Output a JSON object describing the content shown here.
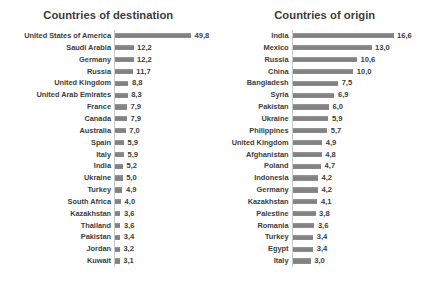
{
  "chart_data": [
    {
      "type": "bar",
      "orientation": "horizontal",
      "title": "Countries of destination",
      "xlabel": "",
      "ylabel": "",
      "grid": false,
      "legend": "none",
      "value_format": "comma-decimal",
      "xlim": [
        0,
        49.8
      ],
      "categories": [
        "United States of America",
        "Saudi Arabia",
        "Germany",
        "Russia",
        "United Kingdom",
        "United Arab Emirates",
        "France",
        "Canada",
        "Australia",
        "Spain",
        "Italy",
        "India",
        "Ukraine",
        "Turkey",
        "South Africa",
        "Kazakhstan",
        "Thailand",
        "Pakistan",
        "Jordan",
        "Kuwait"
      ],
      "values": [
        49.8,
        12.2,
        12.2,
        11.7,
        8.8,
        8.3,
        7.9,
        7.9,
        7.0,
        5.9,
        5.9,
        5.2,
        5.0,
        4.9,
        4.0,
        3.6,
        3.6,
        3.4,
        3.2,
        3.1
      ],
      "value_labels": [
        "49,8",
        "12,2",
        "12,2",
        "11,7",
        "8,8",
        "8,3",
        "7,9",
        "7,9",
        "7,0",
        "5,9",
        "5,9",
        "5,2",
        "5,0",
        "4,9",
        "4,0",
        "3,6",
        "3,6",
        "3,4",
        "3,2",
        "3,1"
      ]
    },
    {
      "type": "bar",
      "orientation": "horizontal",
      "title": "Countries of origin",
      "xlabel": "",
      "ylabel": "",
      "grid": false,
      "legend": "none",
      "value_format": "comma-decimal",
      "xlim": [
        0,
        16.6
      ],
      "categories": [
        "India",
        "Mexico",
        "Russia",
        "China",
        "Bangladesh",
        "Syria",
        "Pakistan",
        "Ukraine",
        "Philippines",
        "United Kingdom",
        "Afghanistan",
        "Poland",
        "Indonesia",
        "Germany",
        "Kazakhstan",
        "Palestine",
        "Romania",
        "Turkey",
        "Egypt",
        "Italy"
      ],
      "values": [
        16.6,
        13.0,
        10.6,
        10.0,
        7.5,
        6.9,
        6.0,
        5.9,
        5.7,
        4.9,
        4.8,
        4.7,
        4.2,
        4.2,
        4.1,
        3.8,
        3.6,
        3.4,
        3.4,
        3.0
      ],
      "value_labels": [
        "16,6",
        "13,0",
        "10,6",
        "10,0",
        "7,5",
        "6,9",
        "6,0",
        "5,9",
        "5,7",
        "4,9",
        "4,8",
        "4,7",
        "4,2",
        "4,2",
        "4,1",
        "3,8",
        "3,6",
        "3,4",
        "3,4",
        "3,0"
      ]
    }
  ],
  "colors": {
    "bar": "#878787",
    "axis": "#c9c9c9",
    "text": "#3d3d3d",
    "title": "#3b3b3b",
    "background": "#ffffff"
  },
  "layout": {
    "left_panel": {
      "axis_x": 114,
      "bar_max_px": 76,
      "label_right": 111,
      "plot_top": 30,
      "row_height": 11.85
    },
    "right_panel": {
      "axis_x": 75,
      "bar_max_px": 101,
      "label_right": 72,
      "plot_top": 30,
      "row_height": 11.85
    }
  }
}
